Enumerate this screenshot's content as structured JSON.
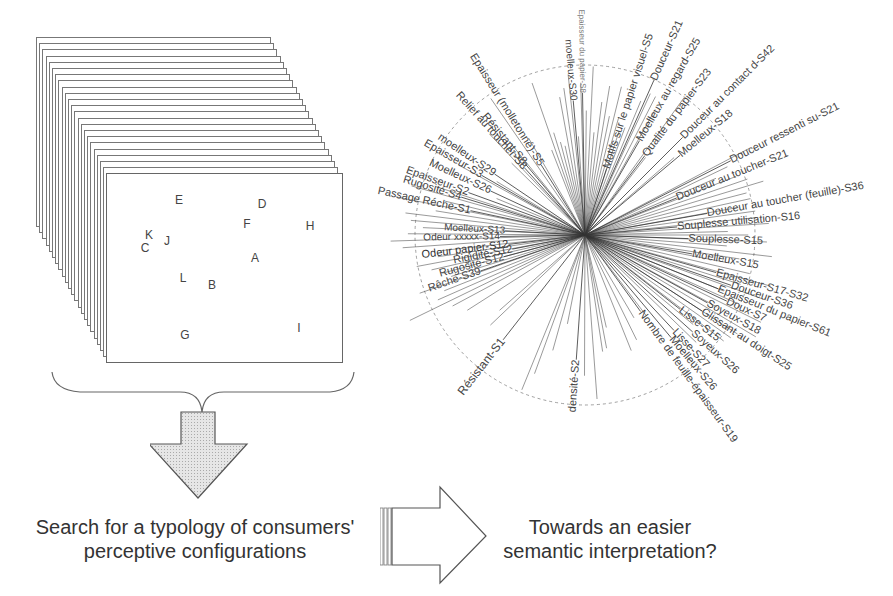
{
  "stack": {
    "sheet_count": 22,
    "points": [
      {
        "label": "E",
        "x": 179,
        "y": 200
      },
      {
        "label": "D",
        "x": 262,
        "y": 204
      },
      {
        "label": "F",
        "x": 247,
        "y": 224
      },
      {
        "label": "H",
        "x": 310,
        "y": 226
      },
      {
        "label": "K",
        "x": 149,
        "y": 235
      },
      {
        "label": "J",
        "x": 167,
        "y": 241
      },
      {
        "label": "C",
        "x": 145,
        "y": 248
      },
      {
        "label": "A",
        "x": 255,
        "y": 258
      },
      {
        "label": "L",
        "x": 183,
        "y": 278
      },
      {
        "label": "B",
        "x": 212,
        "y": 285
      },
      {
        "label": "G",
        "x": 185,
        "y": 335
      },
      {
        "label": "I",
        "x": 299,
        "y": 328
      }
    ]
  },
  "captions": {
    "left_line1": "Search for a typology of consumers'",
    "left_line2": "perceptive configurations",
    "right_line1": "Towards an easier",
    "right_line2": "semantic interpretation?"
  },
  "chart_data": {
    "type": "radial-correlation-circle",
    "center": [
      225,
      235
    ],
    "circle_radius": 170,
    "labels": [
      {
        "text": "Epaisseur du papier-S8",
        "angle": -91,
        "len": 230,
        "size": 8,
        "color": "#777"
      },
      {
        "text": "moelleux-S30",
        "angle": -95,
        "len": 195,
        "size": 10,
        "color": "#444"
      },
      {
        "text": "Epaisseur (molletonné)-S5",
        "angle": -122,
        "len": 220,
        "size": 11,
        "color": "#444"
      },
      {
        "text": "Relief au toucher-S8",
        "angle": -132,
        "len": 200,
        "size": 11,
        "color": "#444"
      },
      {
        "text": "Résistant-S8",
        "angle": -130,
        "len": 160,
        "size": 11,
        "color": "#444"
      },
      {
        "text": "moelleux-S29",
        "angle": -146,
        "len": 175,
        "size": 11,
        "color": "#444"
      },
      {
        "text": "Epaisseur-S3",
        "angle": -150,
        "len": 185,
        "size": 11,
        "color": "#444"
      },
      {
        "text": "Moelleux-S26",
        "angle": -155,
        "len": 170,
        "size": 11,
        "color": "#444"
      },
      {
        "text": "Epaisseur-S2",
        "angle": -160,
        "len": 190,
        "size": 11,
        "color": "#444"
      },
      {
        "text": "Rugosité-S4",
        "angle": -163,
        "len": 190,
        "size": 11,
        "color": "#444"
      },
      {
        "text": "Passage Réche-S1",
        "angle": -168,
        "len": 205,
        "size": 11,
        "color": "#444"
      },
      {
        "text": "Moelleux-S13",
        "angle": -177,
        "len": 140,
        "size": 10,
        "color": "#444"
      },
      {
        "text": "Odeur xxxxx-S14",
        "angle": 179,
        "len": 160,
        "size": 10,
        "color": "#444"
      },
      {
        "text": "Odeur papier-S12",
        "angle": 173,
        "len": 165,
        "size": 11,
        "color": "#333"
      },
      {
        "text": "Rigidité-S12",
        "angle": 169,
        "len": 140,
        "size": 11,
        "color": "#444"
      },
      {
        "text": "Rugosité-S12",
        "angle": 165,
        "len": 150,
        "size": 11,
        "color": "#444"
      },
      {
        "text": "Rêche-S39",
        "angle": 161,
        "len": 160,
        "size": 11,
        "color": "#444"
      },
      {
        "text": "Résistant-S1",
        "angle": 128,
        "len": 205,
        "size": 12,
        "color": "#444"
      },
      {
        "text": "densité-S2",
        "angle": 94,
        "len": 180,
        "size": 11,
        "color": "#444"
      },
      {
        "text": "Motifs sur le papier visuel-S5",
        "angle": -72,
        "len": 235,
        "size": 11,
        "color": "#444"
      },
      {
        "text": "Douceur-S21",
        "angle": -66,
        "len": 230,
        "size": 11,
        "color": "#444"
      },
      {
        "text": "Moelleux au regard-S25",
        "angle": -60,
        "len": 230,
        "size": 11,
        "color": "#444"
      },
      {
        "text": "Qualité du papier-S23",
        "angle": -53,
        "len": 215,
        "size": 11,
        "color": "#444"
      },
      {
        "text": "Douceur au contact d-S42",
        "angle": -45,
        "len": 270,
        "size": 11,
        "color": "#444"
      },
      {
        "text": "Moelleux-S18",
        "angle": -40,
        "len": 190,
        "size": 11,
        "color": "#444"
      },
      {
        "text": "Douceur ressenti su-S21",
        "angle": -27,
        "len": 290,
        "size": 11,
        "color": "#444"
      },
      {
        "text": "Douceur au toucher-S21",
        "angle": -22,
        "len": 220,
        "size": 11,
        "color": "#444"
      },
      {
        "text": "Douceur au toucher (feuille)-S36",
        "angle": -10,
        "len": 300,
        "size": 11,
        "color": "#444"
      },
      {
        "text": "Souplesse utilisation-S16",
        "angle": -5,
        "len": 230,
        "size": 11,
        "color": "#444"
      },
      {
        "text": "Souplesse-S15",
        "angle": 2,
        "len": 175,
        "size": 11,
        "color": "#444"
      },
      {
        "text": "Moelleux-S15",
        "angle": 10,
        "len": 175,
        "size": 11,
        "color": "#444"
      },
      {
        "text": "Epaisseur-S17-S32",
        "angle": 16,
        "len": 230,
        "size": 11,
        "color": "#444"
      },
      {
        "text": "Douceur-S36",
        "angle": 19,
        "len": 215,
        "size": 11,
        "color": "#444"
      },
      {
        "text": "Epaisseur du papier-S61",
        "angle": 22,
        "len": 270,
        "size": 11,
        "color": "#444"
      },
      {
        "text": "Doux-S7",
        "angle": 25,
        "len": 195,
        "size": 11,
        "color": "#444"
      },
      {
        "text": "Soyeux-S18",
        "angle": 29,
        "len": 195,
        "size": 11,
        "color": "#444"
      },
      {
        "text": "Glissant au doigt-S25",
        "angle": 33,
        "len": 255,
        "size": 11,
        "color": "#444"
      },
      {
        "text": "Lisse-S15",
        "angle": 38,
        "len": 170,
        "size": 11,
        "color": "#444"
      },
      {
        "text": "Soyeux-S26",
        "angle": 42,
        "len": 200,
        "size": 11,
        "color": "#444"
      },
      {
        "text": "Lisse-S27",
        "angle": 47,
        "len": 180,
        "size": 11,
        "color": "#444"
      },
      {
        "text": "Moelleux-S26",
        "angle": 50,
        "len": 200,
        "size": 11,
        "color": "#444"
      },
      {
        "text": "Nombre de feuille-épaisseur-S19",
        "angle": 54,
        "len": 265,
        "size": 11,
        "color": "#444"
      }
    ]
  }
}
